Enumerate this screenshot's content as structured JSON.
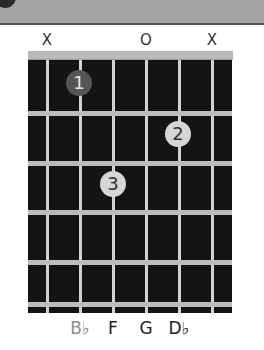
{
  "chord": {
    "string_markers": [
      {
        "string": 1,
        "x": 47,
        "label": "X"
      },
      {
        "string": 4,
        "x": 146,
        "label": "O"
      },
      {
        "string": 6,
        "x": 212,
        "label": "X"
      }
    ],
    "fingers": [
      {
        "label": "1",
        "string": 2,
        "fret": 1,
        "x": 79,
        "y": 83,
        "root": true
      },
      {
        "label": "2",
        "string": 5,
        "fret": 2,
        "x": 178,
        "y": 134,
        "root": false
      },
      {
        "label": "3",
        "string": 3,
        "fret": 3,
        "x": 113,
        "y": 184,
        "root": false
      }
    ],
    "notes": [
      {
        "x": 80,
        "label": "B♭",
        "root": true
      },
      {
        "x": 113,
        "label": "F",
        "root": false
      },
      {
        "x": 146,
        "label": "G",
        "root": false
      },
      {
        "x": 179,
        "label": "D♭",
        "root": false
      }
    ],
    "strings_x": [
      47,
      80,
      113,
      146,
      179,
      212
    ],
    "frets_y": [
      113,
      163,
      212,
      262,
      304
    ],
    "colors": {
      "board": "#141414",
      "root_finger": "#555555",
      "finger": "#d6d6d6",
      "root_note": "#8c8c8c"
    }
  }
}
